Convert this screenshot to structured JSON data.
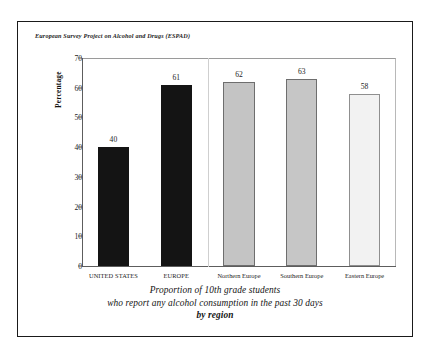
{
  "figure": {
    "source_label": "European Survey Project on Alcohol and  Drugs (ESPAD)",
    "caption_line_1": "Proportion of 10th grade students",
    "caption_line_2": "who report any alcohol consumption in the past 30 days",
    "caption_line_3": "by region"
  },
  "chart_data": {
    "type": "bar",
    "title": "European Survey Project on Alcohol and  Drugs (ESPAD)",
    "subtitle": "Proportion of 10th grade students who report any alcohol consumption in the past 30 days by region",
    "categories": [
      "UNITED STATES",
      "EUROPE",
      "Northern Europe",
      "Southern Europe",
      "Eastern Europe"
    ],
    "values": [
      40,
      61,
      62,
      63,
      58
    ],
    "value_labels": [
      "40",
      "61",
      "62",
      "63",
      "58"
    ],
    "bar_colors": [
      "#141414",
      "#141414",
      "#c4c4c4",
      "#c6c6c6",
      "#f2f2f2"
    ],
    "bar_border_colors": [
      "#141414",
      "#141414",
      "#6e6e6e",
      "#6e6e6e",
      "#8f8f8f"
    ],
    "xlabel": "",
    "ylabel": "Percentage",
    "ylim": [
      0,
      70
    ],
    "yticks": [
      0,
      10,
      20,
      30,
      40,
      50,
      60,
      70
    ],
    "ytick_labels": [
      "0",
      "10",
      "20",
      "30",
      "40",
      "50",
      "60",
      "70"
    ],
    "grid": false,
    "legend": "none",
    "group_divider_after_index": 1
  }
}
